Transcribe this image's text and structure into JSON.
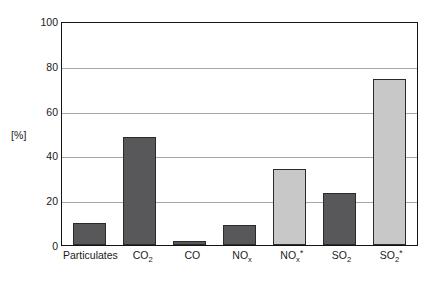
{
  "chart_data": {
    "type": "bar",
    "title": "",
    "subtitle": "",
    "xlabel": "",
    "ylabel": "[%]",
    "ylim": [
      0,
      100
    ],
    "yticks": [
      0,
      20,
      40,
      60,
      80,
      100
    ],
    "grid": "horizontal",
    "legend": "none",
    "categories": [
      "Particulates",
      "CO2",
      "CO",
      "NOx",
      "NOx*",
      "SO2",
      "SO2*"
    ],
    "category_labels": [
      {
        "base": "Particulates",
        "sub": "",
        "sup": ""
      },
      {
        "base": "CO",
        "sub": "2",
        "sup": ""
      },
      {
        "base": "CO",
        "sub": "",
        "sup": ""
      },
      {
        "base": "NO",
        "sub": "x",
        "sup": ""
      },
      {
        "base": "NO",
        "sub": "x",
        "sup": "*"
      },
      {
        "base": "SO",
        "sub": "2",
        "sup": ""
      },
      {
        "base": "SO",
        "sub": "2",
        "sup": "*"
      }
    ],
    "values": [
      10,
      48,
      2,
      9,
      34,
      23,
      74
    ],
    "bar_styles": [
      "dark",
      "dark",
      "dark",
      "dark",
      "light",
      "dark",
      "light"
    ]
  },
  "colors": {
    "bar_dark": "#58585a",
    "bar_light": "#c8c8c8",
    "bar_border": "#2b2b2b",
    "gridline": "#a8a8a8",
    "frame": "#141414",
    "background": "#ffffff",
    "text": "#1a1a1a"
  },
  "axis": {
    "unit_label": "[%]",
    "y_tick_labels": [
      "100",
      "80",
      "60",
      "40",
      "20",
      "0"
    ]
  }
}
